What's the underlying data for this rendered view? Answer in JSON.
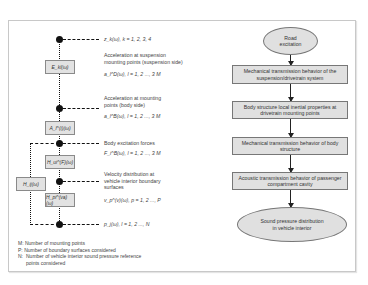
{
  "left_diagram": {
    "blocks": {
      "E": "E_kl(ω)",
      "A": "A_l^(i)(ω)",
      "H_ui": "H_ui^(F)(ω)",
      "H_pi": "H_pi^(va)(ω)",
      "H_ij": "H_ij(ω)"
    },
    "annotations": [
      {
        "id": "z",
        "eq": "z_k(ω), k = 1, 2, 3, 4"
      },
      {
        "id": "susp",
        "text": "Acceleration at suspension mounting points (suspension side)",
        "eq": "a_l^D(ω), l = 1, 2 ..., 3 M"
      },
      {
        "id": "body",
        "text": "Acceleration at mounting points (body side)",
        "eq": "a_l^B(ω), l = 1, 2 ..., 3 M"
      },
      {
        "id": "force",
        "text": "Body excitation forces",
        "eq": "F_i^B(ω), l = 1, 2 ..., 3 M"
      },
      {
        "id": "vel",
        "text": "Velocity distribution at vehicle interior boundary surfaces",
        "eq": "v_p^(v)(ω), p = 1, 2 ..., P"
      },
      {
        "id": "pres",
        "eq": "p_j(ω), l = 1, 2 ..., N"
      }
    ],
    "legend": [
      {
        "key": "M:",
        "text": "Number of mounting points"
      },
      {
        "key": "P:",
        "text": "Number of boundary surfaces considered"
      },
      {
        "key": "N:",
        "text": "Number of vehicle interior sound pressure reference points considered"
      }
    ]
  },
  "right_flow": {
    "start": "Road excitation",
    "steps": [
      "Mechanical transmission behavior of the suspension/drivetrain system",
      "Body structure local inertial properties at drivetrain mounting points",
      "Mechanical transmission behavior of body structure",
      "Acoustic transmission behavior of passenger compartment cavity"
    ],
    "end": "Sound pressure distribution in vehicle interior"
  }
}
